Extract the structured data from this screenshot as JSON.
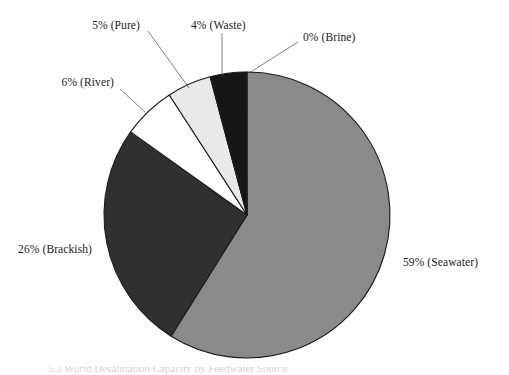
{
  "figure": {
    "background_color": "#ffffff",
    "caption_fragment": "5.3   World Desalination Capacity by Feedwater Source"
  },
  "chart_data": {
    "type": "pie",
    "title": "",
    "categories": [
      "Seawater",
      "Brackish",
      "River",
      "Pure",
      "Waste",
      "Brine"
    ],
    "values": [
      59,
      26,
      6,
      5,
      4,
      0
    ],
    "value_unit": "%",
    "labels": [
      "59% (Seawater)",
      "26% (Brackish)",
      "6% (River)",
      "5% (Pure)",
      "4% (Waste)",
      "0% (Brine)"
    ],
    "colors": [
      "#8a8a8a",
      "#303030",
      "#ffffff",
      "#e9e9e9",
      "#161616",
      "#2a2a2a"
    ],
    "slice_border_color": "#1a1a1a",
    "start_angle_deg": 0,
    "direction": "clockwise",
    "legend": "none",
    "grid": false,
    "label_placement": "outside-with-leader-lines"
  },
  "slices": [
    {
      "name": "Seawater",
      "percent": 59,
      "label": "59% (Seawater)",
      "color": "#8a8a8a",
      "label_x": 403,
      "label_y": 266,
      "label_anchor": "start",
      "leader": false
    },
    {
      "name": "Brackish",
      "percent": 26,
      "label": "26% (Brackish)",
      "color": "#303030",
      "label_x": 92,
      "label_y": 253,
      "label_anchor": "end",
      "leader": false
    },
    {
      "name": "River",
      "percent": 6,
      "label": "6% (River)",
      "color": "#ffffff",
      "label_x": 114,
      "label_y": 86,
      "label_anchor": "end",
      "leader": true,
      "leader_path": "M 120 89 L 145 112"
    },
    {
      "name": "Pure",
      "percent": 5,
      "label": "5% (Pure)",
      "color": "#e9e9e9",
      "label_x": 140,
      "label_y": 29,
      "label_anchor": "end",
      "leader": true,
      "leader_path": "M 148 31 L 189 88"
    },
    {
      "name": "Waste",
      "percent": 4,
      "label": "4% (Waste)",
      "color": "#161616",
      "label_x": 191,
      "label_y": 29,
      "label_anchor": "start",
      "leader": true,
      "leader_path": "M 222 33 L 222 76"
    },
    {
      "name": "Brine",
      "percent": 0,
      "label": "0% (Brine)",
      "color": "#2a2a2a",
      "label_x": 303,
      "label_y": 41,
      "label_anchor": "start",
      "leader": true,
      "leader_path": "M 298 42 L 249 73"
    }
  ],
  "geometry": {
    "center_x": 247,
    "center_y": 215,
    "radius": 143
  }
}
